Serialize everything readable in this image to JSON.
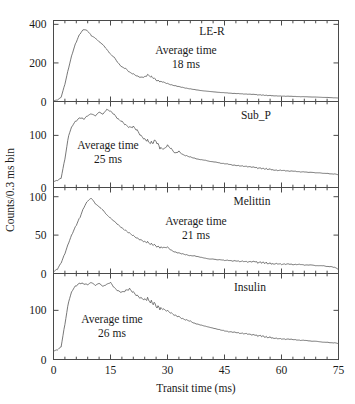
{
  "figure": {
    "xlabel": "Transit time (ms)",
    "ylabel": "Counts/0.3 ms bin",
    "xlim": [
      0,
      75
    ],
    "xticks": [
      0,
      15,
      30,
      45,
      60,
      75
    ],
    "xticklabels": [
      "0",
      "15",
      "30",
      "45",
      "60",
      "75"
    ],
    "xminor_step": 3,
    "grid": false,
    "legend": "none",
    "series_color": "#555555",
    "frame_color": "#4a4a4a"
  },
  "chart_data": [
    {
      "type": "line",
      "title": "LE-R",
      "panel_index": 0,
      "xlabel": "",
      "ylabel": "Counts/0.3 ms bin",
      "xlim": [
        0,
        75
      ],
      "ylim": [
        0,
        420
      ],
      "yticks": [
        0,
        200,
        400
      ],
      "yticklabels": [
        "0",
        "200",
        "400"
      ],
      "annotation_line1": "Average time",
      "annotation_line2": "18 ms",
      "average_time_ms": 18,
      "x": [
        0,
        1,
        2,
        3,
        4,
        5,
        6,
        7,
        8,
        9,
        10,
        11,
        12,
        13,
        14,
        15,
        16,
        17,
        18,
        19,
        20,
        21,
        22,
        23,
        24,
        25,
        26,
        27,
        28,
        29,
        30,
        31,
        32,
        33,
        34,
        35,
        36,
        37,
        38,
        39,
        40,
        41,
        42,
        43,
        44,
        45,
        46,
        47,
        48,
        49,
        50,
        51,
        52,
        53,
        54,
        55,
        56,
        57,
        58,
        59,
        60,
        61,
        62,
        63,
        64,
        65,
        66,
        67,
        68,
        69,
        70,
        71,
        72,
        73,
        74,
        75
      ],
      "values": [
        5,
        8,
        22,
        90,
        175,
        250,
        305,
        345,
        365,
        355,
        330,
        318,
        300,
        285,
        262,
        238,
        222,
        195,
        175,
        168,
        150,
        142,
        132,
        126,
        130,
        138,
        126,
        112,
        104,
        98,
        92,
        86,
        82,
        78,
        74,
        70,
        67,
        64,
        61,
        58,
        56,
        54,
        52,
        50,
        48,
        47,
        45,
        43,
        42,
        41,
        39,
        38,
        37,
        36,
        34,
        33,
        32,
        31,
        30,
        29,
        28,
        27,
        27,
        26,
        25,
        24,
        24,
        23,
        22,
        22,
        21,
        20,
        20,
        19,
        18,
        18
      ]
    },
    {
      "type": "line",
      "title": "Sub_P",
      "panel_index": 1,
      "xlabel": "",
      "ylabel": "",
      "xlim": [
        0,
        75
      ],
      "ylim": [
        0,
        165
      ],
      "yticks": [
        0,
        100
      ],
      "yticklabels": [
        "0",
        "100"
      ],
      "annotation_line1": "Average time",
      "annotation_line2": "25 ms",
      "average_time_ms": 25,
      "x": [
        0,
        1,
        2,
        3,
        4,
        5,
        6,
        7,
        8,
        9,
        10,
        11,
        12,
        13,
        14,
        15,
        16,
        17,
        18,
        19,
        20,
        21,
        22,
        23,
        24,
        25,
        26,
        27,
        28,
        29,
        30,
        31,
        32,
        33,
        34,
        35,
        36,
        37,
        38,
        39,
        40,
        41,
        42,
        43,
        44,
        45,
        46,
        47,
        48,
        49,
        50,
        51,
        52,
        53,
        54,
        55,
        56,
        57,
        58,
        59,
        60,
        61,
        62,
        63,
        64,
        65,
        66,
        67,
        68,
        69,
        70,
        71,
        72,
        73,
        74,
        75
      ],
      "values": [
        12,
        14,
        18,
        55,
        100,
        118,
        126,
        131,
        128,
        134,
        137,
        133,
        140,
        136,
        145,
        142,
        136,
        128,
        124,
        118,
        114,
        116,
        110,
        100,
        94,
        88,
        86,
        90,
        76,
        72,
        80,
        74,
        66,
        70,
        64,
        62,
        60,
        58,
        56,
        55,
        54,
        52,
        51,
        50,
        48,
        47,
        46,
        44,
        43,
        42,
        41,
        40,
        39,
        38,
        37,
        36,
        36,
        35,
        34,
        33,
        33,
        32,
        31,
        31,
        30,
        29,
        29,
        28,
        28,
        27,
        27,
        26,
        26,
        25,
        25,
        24
      ]
    },
    {
      "type": "line",
      "title": "Melittin",
      "panel_index": 2,
      "xlabel": "",
      "ylabel": "",
      "xlim": [
        0,
        75
      ],
      "ylim": [
        0,
        112
      ],
      "yticks": [
        0,
        50,
        100
      ],
      "yticklabels": [
        "0",
        "50",
        "100"
      ],
      "annotation_line1": "Average time",
      "annotation_line2": "21 ms",
      "average_time_ms": 21,
      "x": [
        0,
        1,
        2,
        3,
        4,
        5,
        6,
        7,
        8,
        9,
        10,
        11,
        12,
        13,
        14,
        15,
        16,
        17,
        18,
        19,
        20,
        21,
        22,
        23,
        24,
        25,
        26,
        27,
        28,
        29,
        30,
        31,
        32,
        33,
        34,
        35,
        36,
        37,
        38,
        39,
        40,
        41,
        42,
        43,
        44,
        45,
        46,
        47,
        48,
        49,
        50,
        51,
        52,
        53,
        54,
        55,
        56,
        57,
        58,
        59,
        60,
        61,
        62,
        63,
        64,
        65,
        66,
        67,
        68,
        69,
        70,
        71,
        72,
        73,
        74,
        75
      ],
      "values": [
        3,
        6,
        14,
        26,
        40,
        52,
        62,
        72,
        84,
        92,
        95,
        88,
        84,
        80,
        74,
        70,
        66,
        62,
        58,
        55,
        52,
        49,
        46,
        44,
        42,
        40,
        38,
        36,
        34,
        33,
        34,
        30,
        28,
        27,
        26,
        25,
        24,
        24,
        23,
        22,
        21,
        20,
        20,
        19,
        19,
        18,
        18,
        17,
        17,
        16,
        16,
        15,
        15,
        15,
        14,
        14,
        14,
        13,
        13,
        13,
        12,
        12,
        12,
        11,
        11,
        11,
        10,
        10,
        10,
        9,
        9,
        9,
        8,
        8,
        7,
        5
      ]
    },
    {
      "type": "line",
      "title": "Insulin",
      "panel_index": 3,
      "xlabel": "Transit time (ms)",
      "ylabel": "",
      "xlim": [
        0,
        75
      ],
      "ylim": [
        0,
        175
      ],
      "yticks": [
        0,
        100
      ],
      "yticklabels": [
        "0",
        "100"
      ],
      "annotation_line1": "Average time",
      "annotation_line2": "26 ms",
      "average_time_ms": 26,
      "x": [
        0,
        1,
        2,
        3,
        4,
        5,
        6,
        7,
        8,
        9,
        10,
        11,
        12,
        13,
        14,
        15,
        16,
        17,
        18,
        19,
        20,
        21,
        22,
        23,
        24,
        25,
        26,
        27,
        28,
        29,
        30,
        31,
        32,
        33,
        34,
        35,
        36,
        37,
        38,
        39,
        40,
        41,
        42,
        43,
        44,
        45,
        46,
        47,
        48,
        49,
        50,
        51,
        52,
        53,
        54,
        55,
        56,
        57,
        58,
        59,
        60,
        61,
        62,
        63,
        64,
        65,
        66,
        67,
        68,
        69,
        70,
        71,
        72,
        73,
        74,
        75
      ],
      "values": [
        18,
        20,
        26,
        72,
        118,
        140,
        148,
        152,
        150,
        148,
        152,
        146,
        150,
        144,
        148,
        152,
        142,
        136,
        134,
        138,
        142,
        136,
        130,
        126,
        124,
        122,
        116,
        110,
        104,
        100,
        98,
        94,
        90,
        88,
        84,
        82,
        80,
        76,
        74,
        72,
        70,
        68,
        66,
        64,
        62,
        60,
        58,
        57,
        56,
        54,
        53,
        52,
        50,
        49,
        48,
        47,
        46,
        45,
        44,
        43,
        42,
        41,
        41,
        40,
        39,
        38,
        38,
        37,
        36,
        36,
        35,
        34,
        34,
        33,
        33,
        32
      ]
    }
  ]
}
